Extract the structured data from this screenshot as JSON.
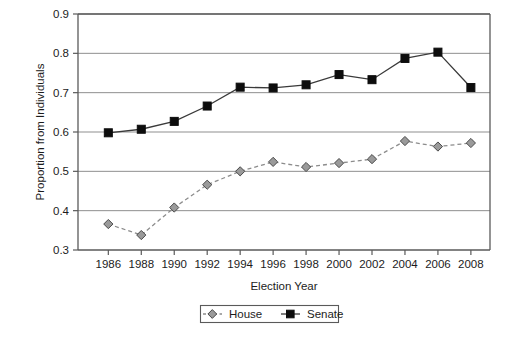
{
  "chart_data": {
    "type": "line",
    "title": "",
    "xlabel": "Election Year",
    "ylabel": "Proportion from Individuals",
    "categories": [
      1986,
      1988,
      1990,
      1992,
      1994,
      1996,
      1998,
      2000,
      2002,
      2004,
      2006,
      2008
    ],
    "x_tick_labels": [
      "1986",
      "1988",
      "1990",
      "1992",
      "1994",
      "1996",
      "1998",
      "2000",
      "2002",
      "2004",
      "2006",
      "2008"
    ],
    "y_tick_labels": [
      "0.3",
      "0.4",
      "0.5",
      "0.6",
      "0.7",
      "0.8",
      "0.9"
    ],
    "y_ticks": [
      0.3,
      0.4,
      0.5,
      0.6,
      0.7,
      0.8,
      0.9
    ],
    "xlim": [
      1985,
      2009
    ],
    "ylim": [
      0.3,
      0.9
    ],
    "grid": "horizontal",
    "legend_position": "bottom-center",
    "series": [
      {
        "name": "House",
        "marker": "diamond",
        "line_style": "dashed",
        "color": "#8c8c8c",
        "marker_fill": "#9a9a9a",
        "marker_edge": "#4a4a4a",
        "values": [
          0.366,
          0.338,
          0.408,
          0.466,
          0.5,
          0.524,
          0.511,
          0.521,
          0.531,
          0.577,
          0.563,
          0.572
        ]
      },
      {
        "name": "Senate",
        "marker": "square",
        "line_style": "solid",
        "color": "#3a3a3a",
        "marker_fill": "#0d0d0d",
        "marker_edge": "#0d0d0d",
        "values": [
          0.598,
          0.607,
          0.627,
          0.666,
          0.714,
          0.712,
          0.72,
          0.746,
          0.733,
          0.787,
          0.803,
          0.713
        ]
      }
    ]
  },
  "legend": {
    "items": [
      {
        "label": "House"
      },
      {
        "label": "Senate"
      }
    ]
  }
}
